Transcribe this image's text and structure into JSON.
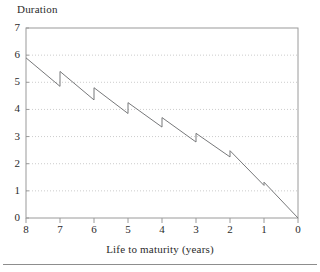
{
  "chart_data": {
    "type": "line",
    "title": "",
    "xlabel": "Life to maturity (years)",
    "ylabel": "Duration",
    "xlim": [
      8,
      0
    ],
    "ylim": [
      0,
      7
    ],
    "x_reversed": true,
    "grid": "horizontal-dotted",
    "legend": "none",
    "xticks": [
      "8",
      "7",
      "6",
      "5",
      "4",
      "3",
      "2",
      "1",
      "0"
    ],
    "xtick_values": [
      8,
      7,
      6,
      5,
      4,
      3,
      2,
      1,
      0
    ],
    "yticks": [
      "0",
      "1",
      "2",
      "3",
      "4",
      "5",
      "6",
      "7"
    ],
    "ytick_values": [
      0,
      1,
      2,
      3,
      4,
      5,
      6,
      7
    ],
    "series": [
      {
        "name": "Duration",
        "style": "sawtooth",
        "description": "Duration declines toward zero as life to maturity shortens, jumping upward at each coupon date",
        "segments": [
          {
            "x_start": 8.0,
            "y_start": 5.9,
            "x_end": 7.0,
            "y_end": 4.85
          },
          {
            "x_start": 7.0,
            "y_start": 5.4,
            "x_end": 6.0,
            "y_end": 4.35
          },
          {
            "x_start": 6.0,
            "y_start": 4.8,
            "x_end": 5.0,
            "y_end": 3.85
          },
          {
            "x_start": 5.0,
            "y_start": 4.25,
            "x_end": 4.0,
            "y_end": 3.35
          },
          {
            "x_start": 4.0,
            "y_start": 3.7,
            "x_end": 3.0,
            "y_end": 2.8
          },
          {
            "x_start": 3.0,
            "y_start": 3.12,
            "x_end": 2.0,
            "y_end": 2.25
          },
          {
            "x_start": 2.0,
            "y_start": 2.48,
            "x_end": 1.0,
            "y_end": 1.2
          },
          {
            "x_start": 1.0,
            "y_start": 1.32,
            "x_end": 0.0,
            "y_end": 0.0
          }
        ]
      }
    ]
  }
}
